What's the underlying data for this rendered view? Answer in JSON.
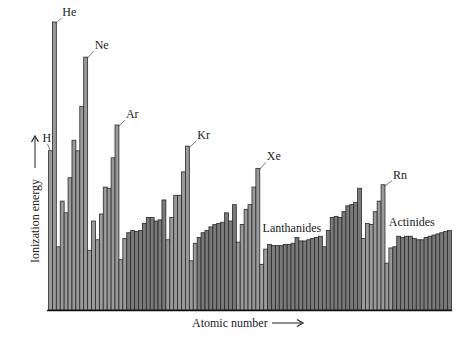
{
  "chart_data": {
    "type": "bar",
    "title": "",
    "xlabel": "Atomic number",
    "ylabel": "Ionization energy",
    "grid": false,
    "legend": null,
    "ylim": [
      0,
      24.6
    ],
    "units": "eV (approximate first ionization energy)",
    "colors": {
      "main_group": "#9a9a9a",
      "transition": "#7a7a7a",
      "outline": "#2a2a2a",
      "axis": "#111111"
    },
    "annotations": [
      {
        "label": "H",
        "z": 1
      },
      {
        "label": "He",
        "z": 2
      },
      {
        "label": "Ne",
        "z": 10
      },
      {
        "label": "Ar",
        "z": 18
      },
      {
        "label": "Kr",
        "z": 36
      },
      {
        "label": "Xe",
        "z": 54
      },
      {
        "label": "Rn",
        "z": 86
      },
      {
        "label": "Lanthanides",
        "z_range": [
          57,
          71
        ]
      },
      {
        "label": "Actinides",
        "z_range": [
          89,
          103
        ]
      }
    ],
    "x": [
      1,
      2,
      3,
      4,
      5,
      6,
      7,
      8,
      9,
      10,
      11,
      12,
      13,
      14,
      15,
      16,
      17,
      18,
      19,
      20,
      21,
      22,
      23,
      24,
      25,
      26,
      27,
      28,
      29,
      30,
      31,
      32,
      33,
      34,
      35,
      36,
      37,
      38,
      39,
      40,
      41,
      42,
      43,
      44,
      45,
      46,
      47,
      48,
      49,
      50,
      51,
      52,
      53,
      54,
      55,
      56,
      57,
      58,
      59,
      60,
      61,
      62,
      63,
      64,
      65,
      66,
      67,
      68,
      69,
      70,
      71,
      72,
      73,
      74,
      75,
      76,
      77,
      78,
      79,
      80,
      81,
      82,
      83,
      84,
      85,
      86,
      87,
      88,
      89,
      90,
      91,
      92,
      93,
      94,
      95,
      96,
      97,
      98,
      99,
      100,
      101,
      102,
      103
    ],
    "values": [
      13.6,
      24.6,
      5.4,
      9.3,
      8.3,
      11.3,
      14.5,
      13.6,
      17.4,
      21.6,
      5.1,
      7.6,
      6.0,
      8.2,
      10.5,
      10.4,
      13.0,
      15.8,
      4.3,
      6.1,
      6.6,
      6.8,
      6.7,
      6.8,
      7.4,
      7.9,
      7.9,
      7.6,
      7.7,
      9.4,
      6.0,
      7.9,
      9.8,
      9.8,
      11.8,
      14.0,
      4.2,
      5.7,
      6.2,
      6.6,
      6.8,
      7.1,
      7.3,
      7.4,
      7.5,
      8.3,
      7.6,
      9.0,
      5.8,
      7.3,
      8.6,
      9.0,
      10.5,
      12.1,
      3.9,
      5.2,
      5.6,
      5.5,
      5.5,
      5.5,
      5.6,
      5.6,
      5.7,
      6.2,
      5.9,
      5.9,
      6.0,
      6.1,
      6.2,
      6.3,
      5.4,
      6.8,
      7.9,
      8.0,
      7.9,
      8.4,
      8.9,
      9.0,
      9.2,
      10.4,
      6.1,
      7.4,
      7.3,
      8.4,
      9.3,
      10.7,
      4.0,
      5.3,
      5.4,
      6.3,
      6.2,
      6.3,
      6.3,
      6.1,
      6.0,
      6.0,
      6.2,
      6.3,
      6.4,
      6.5,
      6.6,
      6.7,
      6.8
    ],
    "block": [
      "s",
      "s",
      "s",
      "s",
      "p",
      "p",
      "p",
      "p",
      "p",
      "p",
      "s",
      "s",
      "p",
      "p",
      "p",
      "p",
      "p",
      "p",
      "s",
      "s",
      "d",
      "d",
      "d",
      "d",
      "d",
      "d",
      "d",
      "d",
      "d",
      "d",
      "p",
      "p",
      "p",
      "p",
      "p",
      "p",
      "s",
      "s",
      "d",
      "d",
      "d",
      "d",
      "d",
      "d",
      "d",
      "d",
      "d",
      "d",
      "p",
      "p",
      "p",
      "p",
      "p",
      "p",
      "s",
      "s",
      "f",
      "f",
      "f",
      "f",
      "f",
      "f",
      "f",
      "f",
      "f",
      "f",
      "f",
      "f",
      "f",
      "f",
      "f",
      "d",
      "d",
      "d",
      "d",
      "d",
      "d",
      "d",
      "d",
      "d",
      "p",
      "p",
      "p",
      "p",
      "p",
      "p",
      "s",
      "s",
      "f",
      "f",
      "f",
      "f",
      "f",
      "f",
      "f",
      "f",
      "f",
      "f",
      "f",
      "f",
      "f",
      "f",
      "f"
    ]
  }
}
